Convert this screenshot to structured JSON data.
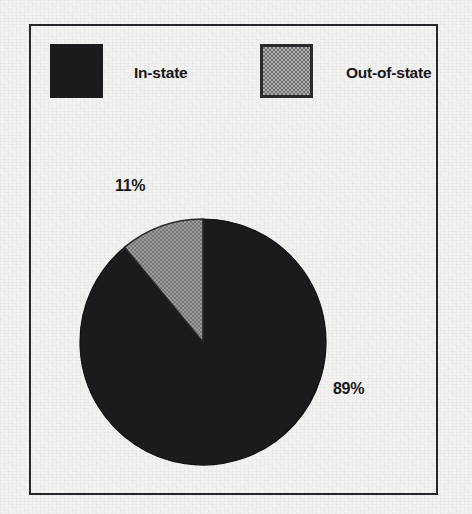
{
  "chart_data": {
    "type": "pie",
    "title": "",
    "subtitle": "",
    "xlabel": "",
    "ylabel": "",
    "grid": false,
    "legend_position": "top",
    "start_angle_deg": 90,
    "direction": "clockwise",
    "categories": [
      "In-state",
      "Out-of-state"
    ],
    "values": [
      89,
      11
    ],
    "value_unit": "%",
    "slices": [
      {
        "label": "In-state",
        "value": 89,
        "value_label": "89%",
        "color": "#1b1b1d",
        "fill_style": "solid-black"
      },
      {
        "label": "Out-of-state",
        "value": 11,
        "value_label": "11%",
        "color": "#8d8d8d",
        "fill_style": "dithered-gray"
      }
    ],
    "annotations": []
  },
  "legend": {
    "items": [
      {
        "label": "In-state",
        "swatch_color": "#1b1b1d"
      },
      {
        "label": "Out-of-state",
        "swatch_color": "#8d8d8d"
      }
    ]
  },
  "labels": {
    "out_of_state_pct": "11%",
    "in_state_pct": "89%"
  },
  "colors": {
    "background": "#f3f3f1",
    "frame_border": "#25252a",
    "ink": "#17171a",
    "dark_slice": "#1b1b1d",
    "gray_slice": "#8d8d8d"
  }
}
